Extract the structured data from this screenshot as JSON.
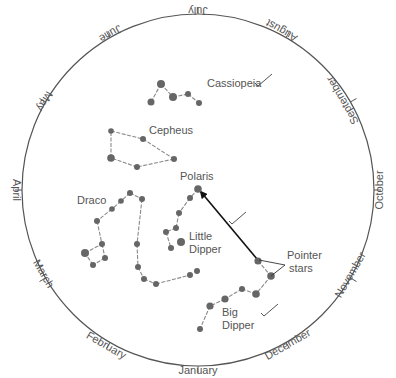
{
  "diagram": {
    "circle": {
      "cx": 198,
      "cy": 190,
      "r": 176,
      "stroke": "#555555"
    },
    "colors": {
      "star": "#666666",
      "line": "#8a8a8a",
      "text": "#555555",
      "arrow": "#111111"
    },
    "months": [
      {
        "label": "July",
        "angle": 0,
        "x": 198,
        "y": 10,
        "rotate": 180
      },
      {
        "label": "August",
        "angle": 30,
        "x": 282,
        "y": 30,
        "rotate": 210
      },
      {
        "label": "September",
        "angle": 60,
        "x": 343,
        "y": 100,
        "rotate": 240
      },
      {
        "label": "October",
        "angle": 90,
        "x": 380,
        "y": 190,
        "rotate": 270
      },
      {
        "label": "November",
        "angle": 120,
        "x": 351,
        "y": 275,
        "rotate": 300
      },
      {
        "label": "December",
        "angle": 150,
        "x": 288,
        "y": 345,
        "rotate": 330
      },
      {
        "label": "January",
        "angle": 180,
        "x": 198,
        "y": 371,
        "rotate": 0
      },
      {
        "label": "February",
        "angle": 210,
        "x": 106,
        "y": 346,
        "rotate": 30
      },
      {
        "label": "March",
        "angle": 240,
        "x": 43,
        "y": 274,
        "rotate": 60
      },
      {
        "label": "April",
        "angle": 270,
        "x": 16,
        "y": 190,
        "rotate": 90
      },
      {
        "label": "May",
        "angle": 300,
        "x": 44,
        "y": 101,
        "rotate": 120
      },
      {
        "label": "June",
        "angle": 330,
        "x": 110,
        "y": 33,
        "rotate": 150
      }
    ],
    "constellations": [
      {
        "name": "Cassiopeia",
        "label": {
          "text": "Cassiopeia",
          "x": 207,
          "y": 87
        },
        "check": true,
        "stars": [
          [
            151,
            102,
            3.5
          ],
          [
            161,
            84,
            4
          ],
          [
            173,
            97,
            4
          ],
          [
            188,
            94,
            3
          ],
          [
            199,
            103,
            3
          ]
        ],
        "lines": [
          [
            0,
            1
          ],
          [
            1,
            2
          ],
          [
            2,
            3
          ],
          [
            3,
            4
          ]
        ]
      },
      {
        "name": "Cepheus",
        "label": {
          "text": "Cepheus",
          "x": 149,
          "y": 134
        },
        "check": false,
        "stars": [
          [
            111,
            131,
            2.8
          ],
          [
            143,
            139,
            3
          ],
          [
            174,
            159,
            3
          ],
          [
            137,
            167,
            3
          ],
          [
            111,
            158,
            3.8
          ]
        ],
        "lines": [
          [
            0,
            1
          ],
          [
            1,
            2
          ],
          [
            2,
            3
          ],
          [
            3,
            4
          ],
          [
            4,
            0
          ]
        ]
      },
      {
        "name": "Draco",
        "label": {
          "text": "Draco",
          "x": 77,
          "y": 204
        },
        "check": false,
        "stars": [
          [
            130,
            193,
            3
          ],
          [
            142,
            199,
            3
          ],
          [
            121,
            201,
            2.8
          ],
          [
            112,
            209,
            2.8
          ],
          [
            97,
            221,
            3
          ],
          [
            102,
            244,
            3
          ],
          [
            105,
            258,
            3
          ],
          [
            93,
            265,
            3
          ],
          [
            85,
            253,
            4
          ],
          [
            137,
            244,
            3
          ],
          [
            138,
            267,
            3
          ],
          [
            144,
            279,
            3
          ],
          [
            156,
            284,
            3
          ],
          [
            190,
            275,
            3
          ],
          [
            197,
            271,
            3
          ]
        ],
        "lines": [
          [
            0,
            1
          ],
          [
            0,
            2
          ],
          [
            2,
            3
          ],
          [
            3,
            4
          ],
          [
            4,
            5
          ],
          [
            5,
            6
          ],
          [
            6,
            7
          ],
          [
            7,
            8
          ],
          [
            8,
            5
          ],
          [
            1,
            9
          ],
          [
            9,
            10
          ],
          [
            10,
            11
          ],
          [
            11,
            12
          ],
          [
            12,
            13
          ]
        ]
      },
      {
        "name": "Little Dipper",
        "label": {
          "text": "Little",
          "text2": "Dipper",
          "x": 189,
          "y": 240
        },
        "check": true,
        "stars": [
          [
            198,
            189,
            3.8
          ],
          [
            190,
            198,
            3
          ],
          [
            179,
            213,
            3
          ],
          [
            176,
            228,
            3
          ],
          [
            166,
            232,
            3
          ],
          [
            171,
            248,
            3
          ],
          [
            181,
            242,
            4
          ]
        ],
        "lines": [
          [
            0,
            1
          ],
          [
            1,
            2
          ],
          [
            2,
            3
          ],
          [
            3,
            4
          ],
          [
            4,
            5
          ]
        ]
      },
      {
        "name": "Big Dipper",
        "label": {
          "text": "Big",
          "text2": "Dipper",
          "x": 222,
          "y": 316
        },
        "check": true,
        "stars": [
          [
            258,
            261,
            3.6
          ],
          [
            271,
            276,
            3.8
          ],
          [
            256,
            294,
            3.8
          ],
          [
            242,
            289,
            3
          ],
          [
            225,
            299,
            3.6
          ],
          [
            210,
            306,
            3.6
          ],
          [
            200,
            329,
            3
          ]
        ],
        "lines": [
          [
            0,
            1
          ],
          [
            1,
            2
          ],
          [
            2,
            3
          ],
          [
            3,
            4
          ],
          [
            4,
            5
          ],
          [
            5,
            6
          ]
        ]
      }
    ],
    "polaris": {
      "label": "Polaris",
      "x": 180,
      "y": 180
    },
    "pointer_stars": {
      "label_line1": "Pointer",
      "label_line2": "stars",
      "x": 287,
      "y": 259
    },
    "arrow": {
      "from": [
        257,
        259
      ],
      "to": [
        201,
        192
      ]
    }
  }
}
